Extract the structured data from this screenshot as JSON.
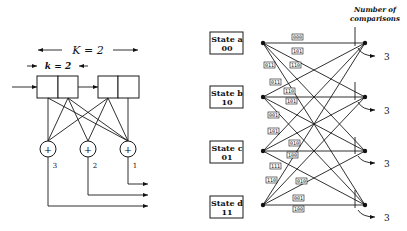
{
  "encoder": {
    "constraint_length_label": "K = 2",
    "k_label": "k = 2",
    "adders": [
      {
        "id": 3,
        "label": "3"
      },
      {
        "id": 2,
        "label": "2"
      },
      {
        "id": 1,
        "label": "1"
      }
    ],
    "adder_symbol": "+"
  },
  "trellis": {
    "header": {
      "line1": "Number of",
      "line2": "comparisons"
    },
    "states": [
      {
        "name": "State a",
        "bits": "00"
      },
      {
        "name": "State b",
        "bits": "10"
      },
      {
        "name": "State c",
        "bits": "01"
      },
      {
        "name": "State d",
        "bits": "11"
      }
    ],
    "comparisons": [
      "3",
      "3",
      "3",
      "3"
    ],
    "branch_labels": [
      {
        "text": "000",
        "x": 292,
        "y": 37
      },
      {
        "text": "101",
        "x": 292,
        "y": 51
      },
      {
        "text": "011",
        "x": 264,
        "y": 65
      },
      {
        "text": "110",
        "x": 290,
        "y": 65
      },
      {
        "text": "011",
        "x": 270,
        "y": 82
      },
      {
        "text": "110",
        "x": 284,
        "y": 91
      },
      {
        "text": "101",
        "x": 286,
        "y": 101
      },
      {
        "text": "001",
        "x": 268,
        "y": 115
      },
      {
        "text": "101",
        "x": 268,
        "y": 131
      },
      {
        "text": "010",
        "x": 289,
        "y": 143
      },
      {
        "text": "100",
        "x": 287,
        "y": 155
      },
      {
        "text": "111",
        "x": 270,
        "y": 166
      },
      {
        "text": "110",
        "x": 266,
        "y": 180
      },
      {
        "text": "010",
        "x": 296,
        "y": 181
      },
      {
        "text": "001",
        "x": 293,
        "y": 198
      },
      {
        "text": "100",
        "x": 293,
        "y": 209
      }
    ]
  }
}
